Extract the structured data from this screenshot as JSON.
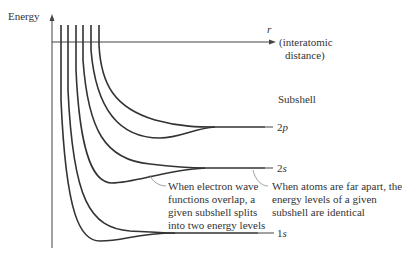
{
  "diagram": {
    "y_axis_label": "Energy",
    "x_axis_symbol": "r",
    "x_axis_desc_line1": "(interatomic",
    "x_axis_desc_line2": "distance)",
    "column_header": "Subshell",
    "levels": [
      {
        "name": "2p",
        "num": "2",
        "letter": "p"
      },
      {
        "name": "2s",
        "num": "2",
        "letter": "s"
      },
      {
        "name": "1s",
        "num": "1",
        "letter": "s"
      }
    ],
    "annotation_overlap": [
      "When electron wave",
      "functions overlap, a",
      "given subshell splits",
      "into two energy levels"
    ],
    "annotation_apart": [
      "When atoms are far apart, the",
      "energy levels of a given",
      "subshell are identical"
    ],
    "colors": {
      "curve": "#333333",
      "axis": "#444444",
      "leader": "#888888",
      "text": "#333333"
    }
  }
}
